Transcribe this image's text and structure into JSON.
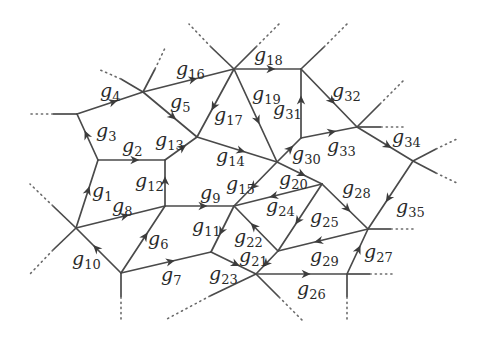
{
  "diagram": {
    "type": "directed-graph",
    "colors": {
      "edge": "#4a4a4a",
      "label": "#2a2a2a",
      "background": "#ffffff"
    },
    "nodes": {
      "A": [
        77,
        114
      ],
      "B": [
        143,
        92
      ],
      "C": [
        234,
        69
      ],
      "D": [
        301,
        69
      ],
      "E": [
        357,
        127
      ],
      "F": [
        413,
        161
      ],
      "G": [
        98,
        160
      ],
      "H": [
        165,
        160
      ],
      "I": [
        197,
        137
      ],
      "J": [
        277,
        162
      ],
      "K": [
        301,
        138
      ],
      "L": [
        76,
        228
      ],
      "M": [
        165,
        206
      ],
      "N": [
        234,
        206
      ],
      "O": [
        322,
        184
      ],
      "P": [
        368,
        229
      ],
      "Q": [
        121,
        273
      ],
      "R": [
        211,
        252
      ],
      "S": [
        256,
        274
      ],
      "T": [
        278,
        251
      ],
      "U": [
        347,
        274
      ]
    },
    "edges": [
      {
        "id": "g1",
        "from": "L",
        "to": "G",
        "label": "g",
        "sub": "1",
        "lx": 92,
        "ly": 197
      },
      {
        "id": "g2",
        "from": "G",
        "to": "H",
        "label": "g",
        "sub": "2",
        "lx": 122,
        "ly": 152
      },
      {
        "id": "g3",
        "from": "G",
        "to": "A",
        "label": "g",
        "sub": "3",
        "lx": 96,
        "ly": 137
      },
      {
        "id": "g4",
        "from": "A",
        "to": "B",
        "label": "g",
        "sub": "4",
        "lx": 100,
        "ly": 97
      },
      {
        "id": "g5",
        "from": "B",
        "to": "I",
        "label": "g",
        "sub": "5",
        "lx": 170,
        "ly": 108
      },
      {
        "id": "g6",
        "from": "Q",
        "to": "M",
        "label": "g",
        "sub": "6",
        "lx": 148,
        "ly": 245
      },
      {
        "id": "g7",
        "from": "Q",
        "to": "R",
        "label": "g",
        "sub": "7",
        "lx": 161,
        "ly": 281
      },
      {
        "id": "g8",
        "from": "L",
        "to": "M",
        "label": "g",
        "sub": "8",
        "lx": 112,
        "ly": 212
      },
      {
        "id": "g9",
        "from": "M",
        "to": "N",
        "label": "g",
        "sub": "9",
        "lx": 200,
        "ly": 199
      },
      {
        "id": "g10",
        "from": "Q",
        "to": "L",
        "label": "g",
        "sub": "10",
        "lx": 72,
        "ly": 265
      },
      {
        "id": "g11",
        "from": "N",
        "to": "R",
        "label": "g",
        "sub": "11",
        "lx": 192,
        "ly": 232
      },
      {
        "id": "g12",
        "from": "M",
        "to": "H",
        "label": "g",
        "sub": "12",
        "lx": 135,
        "ly": 187
      },
      {
        "id": "g13",
        "from": "H",
        "to": "I",
        "label": "g",
        "sub": "13",
        "lx": 155,
        "ly": 146
      },
      {
        "id": "g14",
        "from": "I",
        "to": "J",
        "label": "g",
        "sub": "14",
        "lx": 216,
        "ly": 162
      },
      {
        "id": "g15",
        "from": "J",
        "to": "N",
        "label": "g",
        "sub": "15",
        "lx": 226,
        "ly": 190
      },
      {
        "id": "g16",
        "from": "B",
        "to": "C",
        "label": "g",
        "sub": "16",
        "lx": 176,
        "ly": 75
      },
      {
        "id": "g17",
        "from": "C",
        "to": "I",
        "label": "g",
        "sub": "17",
        "lx": 214,
        "ly": 121
      },
      {
        "id": "g18",
        "from": "C",
        "to": "D",
        "label": "g",
        "sub": "18",
        "lx": 254,
        "ly": 61
      },
      {
        "id": "g19",
        "from": "C",
        "to": "J",
        "label": "g",
        "sub": "19",
        "lx": 252,
        "ly": 100
      },
      {
        "id": "g20",
        "from": "J",
        "to": "O",
        "label": "g",
        "sub": "20",
        "lx": 279,
        "ly": 185
      },
      {
        "id": "g21",
        "from": "T",
        "to": "S",
        "label": "g",
        "sub": "21",
        "lx": 239,
        "ly": 262
      },
      {
        "id": "g22",
        "from": "T",
        "to": "N",
        "label": "g",
        "sub": "22",
        "lx": 234,
        "ly": 243
      },
      {
        "id": "g23",
        "from": "R",
        "to": "S",
        "label": "g",
        "sub": "23",
        "lx": 209,
        "ly": 280
      },
      {
        "id": "g24",
        "from": "O",
        "to": "N",
        "label": "g",
        "sub": "24",
        "lx": 266,
        "ly": 212
      },
      {
        "id": "g25",
        "from": "O",
        "to": "T",
        "label": "g",
        "sub": "25",
        "lx": 310,
        "ly": 223
      },
      {
        "id": "g26",
        "from": "S",
        "to": "U",
        "label": "g",
        "sub": "26",
        "lx": 297,
        "ly": 295
      },
      {
        "id": "g27",
        "from": "U",
        "to": "P",
        "label": "g",
        "sub": "27",
        "lx": 364,
        "ly": 258
      },
      {
        "id": "g28",
        "from": "O",
        "to": "P",
        "label": "g",
        "sub": "28",
        "lx": 342,
        "ly": 194
      },
      {
        "id": "g29",
        "from": "P",
        "to": "T",
        "label": "g",
        "sub": "29",
        "lx": 310,
        "ly": 262
      },
      {
        "id": "g30",
        "from": "J",
        "to": "K",
        "label": "g",
        "sub": "30",
        "lx": 292,
        "ly": 160
      },
      {
        "id": "g31",
        "from": "K",
        "to": "D",
        "label": "g",
        "sub": "31",
        "lx": 273,
        "ly": 115
      },
      {
        "id": "g32",
        "from": "D",
        "to": "E",
        "label": "g",
        "sub": "32",
        "lx": 332,
        "ly": 97
      },
      {
        "id": "g33",
        "from": "K",
        "to": "E",
        "label": "g",
        "sub": "33",
        "lx": 327,
        "ly": 152
      },
      {
        "id": "g34",
        "from": "E",
        "to": "F",
        "label": "g",
        "sub": "34",
        "lx": 392,
        "ly": 143
      },
      {
        "id": "g35",
        "from": "F",
        "to": "P",
        "label": "g",
        "sub": "35",
        "lx": 396,
        "ly": 213
      }
    ],
    "stubs": [
      {
        "from": [
          77,
          114
        ],
        "to": [
          53,
          114
        ],
        "dots_to": [
          30,
          114
        ]
      },
      {
        "from": [
          143,
          92
        ],
        "to": [
          121,
          79
        ],
        "dots_to": [
          98,
          69
        ]
      },
      {
        "from": [
          143,
          92
        ],
        "to": [
          155,
          69
        ],
        "dots_to": [
          166,
          46
        ]
      },
      {
        "from": [
          234,
          69
        ],
        "to": [
          211,
          47
        ],
        "dots_to": [
          189,
          24
        ]
      },
      {
        "from": [
          234,
          69
        ],
        "to": [
          256,
          47
        ],
        "dots_to": [
          279,
          24
        ]
      },
      {
        "from": [
          301,
          69
        ],
        "to": [
          324,
          47
        ],
        "dots_to": [
          347,
          24
        ]
      },
      {
        "from": [
          357,
          127
        ],
        "to": [
          380,
          104
        ],
        "dots_to": [
          403,
          81
        ]
      },
      {
        "from": [
          357,
          127
        ],
        "to": [
          381,
          127
        ],
        "dots_to": [
          403,
          127
        ]
      },
      {
        "from": [
          413,
          161
        ],
        "to": [
          436,
          149
        ],
        "dots_to": [
          459,
          138
        ]
      },
      {
        "from": [
          413,
          161
        ],
        "to": [
          436,
          173
        ],
        "dots_to": [
          459,
          184
        ]
      },
      {
        "from": [
          76,
          228
        ],
        "to": [
          53,
          206
        ],
        "dots_to": [
          30,
          184
        ]
      },
      {
        "from": [
          76,
          228
        ],
        "to": [
          53,
          250
        ],
        "dots_to": [
          30,
          274
        ]
      },
      {
        "from": [
          121,
          273
        ],
        "to": [
          121,
          297
        ],
        "dots_to": [
          121,
          320
        ]
      },
      {
        "from": [
          256,
          274
        ],
        "to": [
          210,
          296
        ],
        "dots_to": [
          165,
          320
        ]
      },
      {
        "from": [
          256,
          274
        ],
        "to": [
          279,
          297
        ],
        "dots_to": [
          302,
          320
        ]
      },
      {
        "from": [
          368,
          229
        ],
        "to": [
          391,
          229
        ],
        "dots_to": [
          413,
          229
        ]
      },
      {
        "from": [
          347,
          274
        ],
        "to": [
          370,
          274
        ],
        "dots_to": [
          392,
          274
        ]
      },
      {
        "from": [
          347,
          274
        ],
        "to": [
          347,
          297
        ],
        "dots_to": [
          347,
          320
        ]
      }
    ]
  }
}
